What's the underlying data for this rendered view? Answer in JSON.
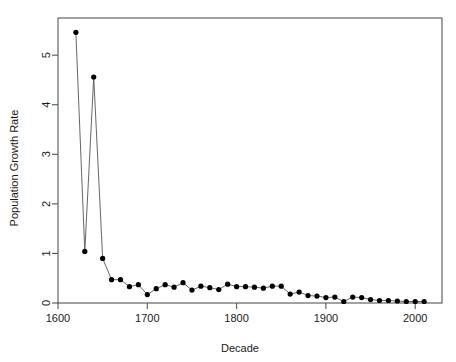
{
  "chart_data": {
    "type": "line",
    "title": "",
    "subtitle": "",
    "xlabel": "Decade",
    "ylabel": "Population Growth Rate",
    "xlim": [
      1600,
      2030
    ],
    "ylim": [
      0,
      5.75
    ],
    "grid": false,
    "legend": null,
    "legend_position": "none",
    "marker": "filled-circle",
    "line_style": "solid",
    "point_color": "#000000",
    "line_color": "#555555",
    "axis_color": "#555555",
    "background_color": "#ffffff",
    "x_ticks": [
      1600,
      1700,
      1800,
      1900,
      2000
    ],
    "x_tick_labels": [
      "1600",
      "1700",
      "1800",
      "1900",
      "2000"
    ],
    "y_ticks": [
      0,
      1,
      2,
      3,
      4,
      5
    ],
    "y_tick_labels": [
      "0",
      "1",
      "2",
      "3",
      "4",
      "5"
    ],
    "series": [
      {
        "name": "Population Growth Rate",
        "x": [
          1620,
          1630,
          1640,
          1650,
          1660,
          1670,
          1680,
          1690,
          1700,
          1710,
          1720,
          1730,
          1740,
          1750,
          1760,
          1770,
          1780,
          1790,
          1800,
          1810,
          1820,
          1830,
          1840,
          1850,
          1860,
          1870,
          1880,
          1890,
          1900,
          1910,
          1920,
          1930,
          1940,
          1950,
          1960,
          1970,
          1980,
          1990,
          2000,
          2010
        ],
        "values": [
          5.46,
          1.04,
          4.56,
          0.9,
          0.47,
          0.47,
          0.33,
          0.37,
          0.17,
          0.29,
          0.37,
          0.32,
          0.41,
          0.26,
          0.34,
          0.31,
          0.27,
          0.38,
          0.33,
          0.33,
          0.32,
          0.3,
          0.34,
          0.34,
          0.18,
          0.22,
          0.15,
          0.14,
          0.11,
          0.12,
          0.03,
          0.12,
          0.11,
          0.07,
          0.05,
          0.05,
          0.04,
          0.03,
          0.03,
          0.03
        ]
      }
    ]
  },
  "axes": {
    "x_title": "Decade",
    "y_title": "Population Growth Rate"
  }
}
